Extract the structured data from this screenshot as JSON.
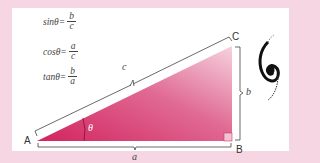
{
  "formulas": [
    {
      "lhs": "sinθ=",
      "num": "b",
      "den": "c"
    },
    {
      "lhs": "cosθ=",
      "num": "a",
      "den": "c"
    },
    {
      "lhs": "tanθ=",
      "num": "b",
      "den": "a"
    }
  ],
  "vertices": {
    "A": "A",
    "B": "B",
    "C": "C"
  },
  "sides": {
    "hypotenuse": "c",
    "adjacent": "a",
    "opposite": "b"
  },
  "angle_label": "θ",
  "colors": {
    "background": "#f6d6e2",
    "triangle_dark": "#d2245f",
    "triangle_light": "#f3c3d4",
    "panel": "#ffffff"
  }
}
